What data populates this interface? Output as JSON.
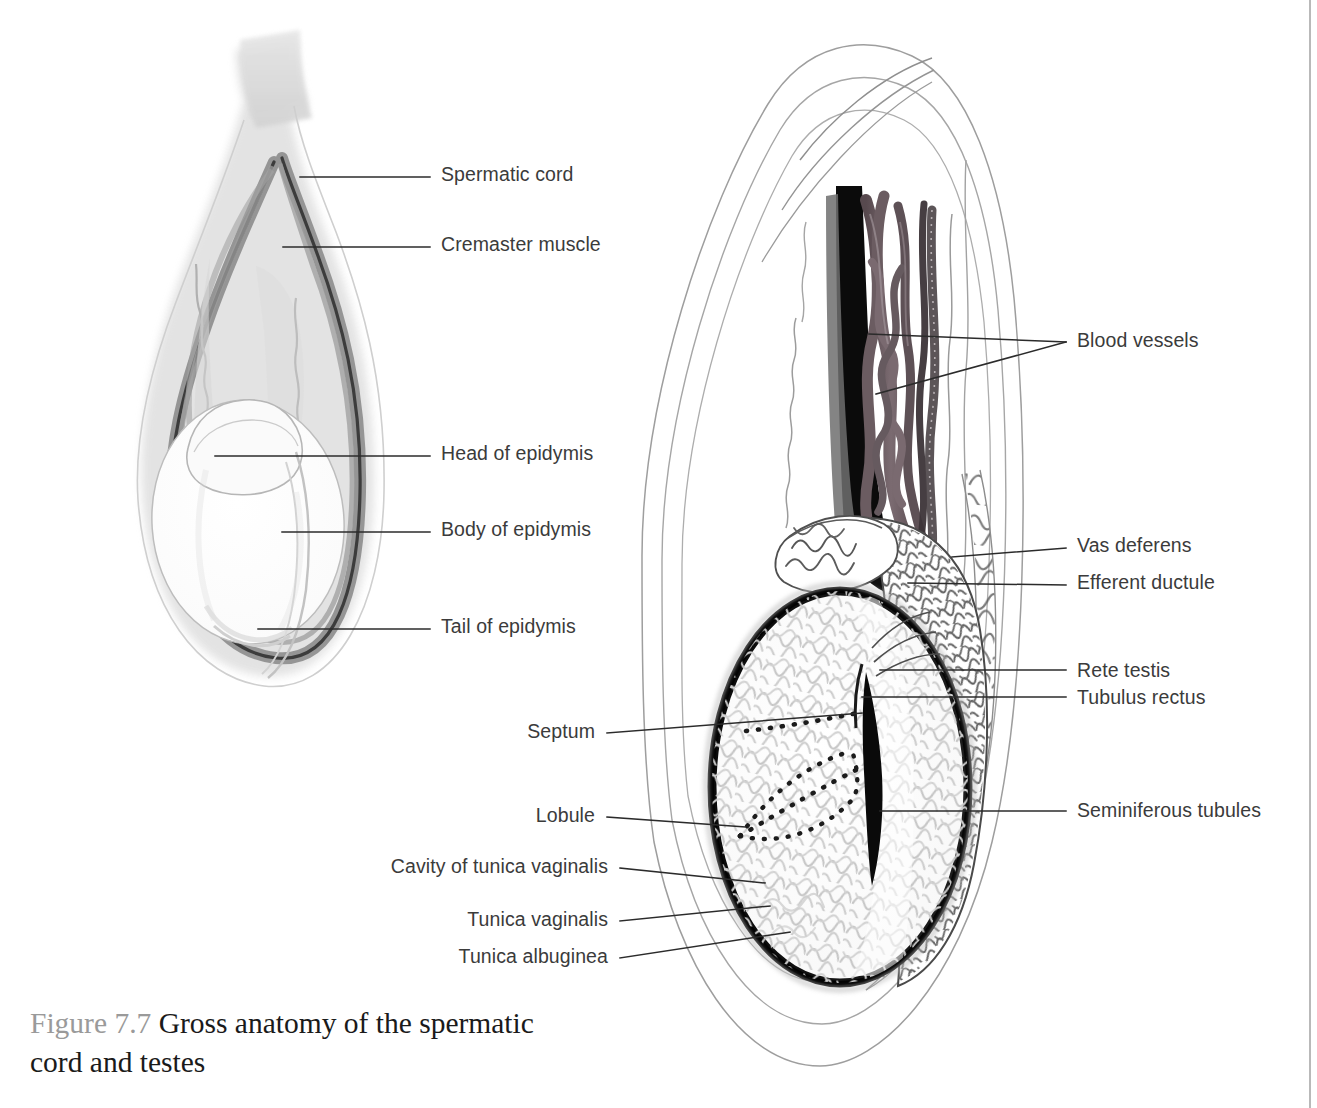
{
  "figure": {
    "number_label": "Figure 7.7",
    "title": "Gross anatomy of the spermatic",
    "title_line2": "cord and testes",
    "full_title": "Gross anatomy of the spermatic cord and testes"
  },
  "colors": {
    "label_text": "#3b3b3b",
    "caption_number": "#9a9a9a",
    "caption_text": "#1a1a1a",
    "leader_line": "#2b2b2b",
    "tunica_albuginea": "#111111",
    "vas_deferens": "#0d0d0d",
    "blood_vessel": "#6d6065",
    "cremaster": "#8a8a8a",
    "scrotal_shade": "#d9d9d9",
    "tubule_line": "#c9c9c9",
    "epididymis_line": "#4a4a4a",
    "margin_rule": "#b9b9b9"
  },
  "left_panel": {
    "name": "sagittal-scrotum-external-view",
    "labels": [
      {
        "id": "spermatic-cord",
        "text": "Spermatic cord",
        "side": "right",
        "x": 441,
        "y": 165,
        "leader": [
          [
            300,
            177
          ],
          [
            430,
            177
          ]
        ],
        "target": [
          300,
          177
        ]
      },
      {
        "id": "cremaster-muscle",
        "text": "Cremaster muscle",
        "side": "right",
        "x": 441,
        "y": 235,
        "leader": [
          [
            283,
            247
          ],
          [
            430,
            247
          ]
        ],
        "target": [
          283,
          247
        ]
      },
      {
        "id": "head-of-epidymis",
        "text": "Head of epidymis",
        "side": "right",
        "x": 441,
        "y": 444,
        "leader": [
          [
            215,
            456
          ],
          [
            430,
            456
          ]
        ],
        "target": [
          215,
          456
        ]
      },
      {
        "id": "body-of-epidymis",
        "text": "Body of epidymis",
        "side": "right",
        "x": 441,
        "y": 520,
        "leader": [
          [
            282,
            532
          ],
          [
            430,
            532
          ]
        ],
        "target": [
          282,
          532
        ]
      },
      {
        "id": "tail-of-epidymis",
        "text": "Tail of epidymis",
        "side": "right",
        "x": 441,
        "y": 617,
        "leader": [
          [
            258,
            629
          ],
          [
            430,
            629
          ]
        ],
        "target": [
          258,
          629
        ]
      }
    ]
  },
  "right_panel": {
    "name": "sagittal-testis-cutaway-view",
    "labels": [
      {
        "id": "blood-vessels",
        "text": "Blood vessels",
        "side": "right",
        "x": 1077,
        "y": 331,
        "leader": [
          [
            869,
            334
          ],
          [
            1066,
            342
          ]
        ],
        "target": [
          869,
          334
        ]
      },
      {
        "id": "blood-vessels-b",
        "text": "",
        "side": "right",
        "x": 1077,
        "y": 331,
        "leader": [
          [
            876,
            394
          ],
          [
            1066,
            342
          ]
        ],
        "target": [
          876,
          394
        ]
      },
      {
        "id": "vas-deferens",
        "text": "Vas deferens",
        "side": "right",
        "x": 1077,
        "y": 536,
        "leader": [
          [
            952,
            557
          ],
          [
            1066,
            548
          ]
        ],
        "target": [
          952,
          557
        ]
      },
      {
        "id": "efferent-ductule",
        "text": "Efferent ductule",
        "side": "right",
        "x": 1077,
        "y": 573,
        "leader": [
          [
            908,
            583
          ],
          [
            1066,
            585
          ]
        ],
        "target": [
          908,
          583
        ]
      },
      {
        "id": "rete-testis",
        "text": "Rete testis",
        "side": "right",
        "x": 1077,
        "y": 661,
        "leader": [
          [
            880,
            670
          ],
          [
            1066,
            670
          ]
        ],
        "target": [
          880,
          670
        ]
      },
      {
        "id": "tubulus-rectus",
        "text": "Tubulus rectus",
        "side": "right",
        "x": 1077,
        "y": 688,
        "leader": [
          [
            862,
            697
          ],
          [
            1066,
            697
          ]
        ],
        "target": [
          862,
          697
        ]
      },
      {
        "id": "seminiferous-tubules",
        "text": "Seminiferous tubules",
        "side": "right",
        "x": 1077,
        "y": 801,
        "leader": [
          [
            880,
            811
          ],
          [
            1066,
            811
          ]
        ],
        "target": [
          880,
          811
        ]
      },
      {
        "id": "septum",
        "text": "Septum",
        "side": "left",
        "x": 595,
        "y": 722,
        "leader": [
          [
            607,
            733
          ],
          [
            862,
            713
          ]
        ],
        "target": [
          862,
          713
        ]
      },
      {
        "id": "lobule",
        "text": "Lobule",
        "side": "left",
        "x": 595,
        "y": 806,
        "leader": [
          [
            607,
            817
          ],
          [
            745,
            827
          ]
        ],
        "target": [
          745,
          827
        ]
      },
      {
        "id": "cavity-of-tunica-vaginalis",
        "text": "Cavity of tunica vaginalis",
        "side": "left",
        "x": 608,
        "y": 857,
        "leader": [
          [
            620,
            868
          ],
          [
            765,
            883
          ]
        ],
        "target": [
          765,
          883
        ]
      },
      {
        "id": "tunica-vaginalis",
        "text": "Tunica vaginalis",
        "side": "left",
        "x": 608,
        "y": 910,
        "leader": [
          [
            620,
            921
          ],
          [
            770,
            906
          ]
        ],
        "target": [
          770,
          906
        ]
      },
      {
        "id": "tunica-albuginea",
        "text": "Tunica albuginea",
        "side": "left",
        "x": 608,
        "y": 947,
        "leader": [
          [
            620,
            958
          ],
          [
            790,
            932
          ]
        ],
        "target": [
          790,
          932
        ]
      }
    ]
  },
  "margin": {
    "rule_visible": true
  }
}
